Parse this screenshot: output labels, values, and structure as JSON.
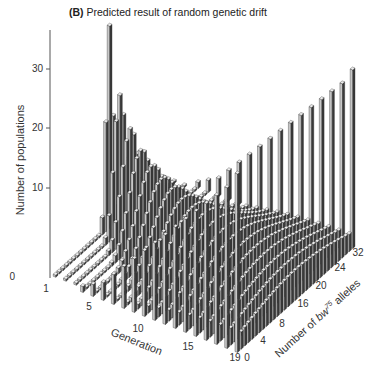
{
  "title": {
    "panel": "(B)",
    "text": "Predicted result of random genetic drift"
  },
  "chart_data": {
    "type": "bar3d",
    "title": "Predicted result of random genetic drift",
    "panel_label": "(B)",
    "zlabel": "Number of populations",
    "xlabel": "Generation",
    "ylabel": "Number of bw75 alleles",
    "ylabel_parts": {
      "prefix": "Number of ",
      "italic": "bw",
      "sup": "75",
      "suffix": " alleles"
    },
    "z_ticks": [
      0,
      10,
      20,
      30
    ],
    "x_ticks": [
      1,
      5,
      10,
      15,
      19
    ],
    "y_ticks": [
      0,
      4,
      8,
      16,
      20,
      24,
      32
    ],
    "x_range": [
      1,
      19
    ],
    "y_range": [
      0,
      32
    ],
    "z_range": [
      0,
      35
    ],
    "grid": false,
    "legend": null,
    "note": "Populations start with 16 bw75 alleles (out of 32); distribution spreads each generation; populations accumulate at 0 (loss) and 32 (fixation).",
    "series_by_generation": [
      {
        "generation": 1,
        "peak_alleles": 16,
        "peak_count": 34,
        "count_at_0": 0,
        "count_at_32": 0
      },
      {
        "generation": 2,
        "peak_alleles": 16,
        "peak_count": 23,
        "count_at_0": 0,
        "count_at_32": 0
      },
      {
        "generation": 3,
        "peak_alleles": 16,
        "peak_count": 18,
        "count_at_0": 0,
        "count_at_32": 0
      },
      {
        "generation": 4,
        "peak_alleles": 16,
        "peak_count": 15,
        "count_at_0": 1,
        "count_at_32": 1
      },
      {
        "generation": 5,
        "peak_alleles": 16,
        "peak_count": 13,
        "count_at_0": 2,
        "count_at_32": 2
      },
      {
        "generation": 6,
        "peak_alleles": 16,
        "peak_count": 11.5,
        "count_at_0": 3,
        "count_at_32": 3
      },
      {
        "generation": 7,
        "peak_alleles": 16,
        "peak_count": 10.5,
        "count_at_0": 5,
        "count_at_32": 5
      },
      {
        "generation": 8,
        "peak_alleles": 16,
        "peak_count": 9.5,
        "count_at_0": 7,
        "count_at_32": 7
      },
      {
        "generation": 9,
        "peak_alleles": 16,
        "peak_count": 8.8,
        "count_at_0": 9,
        "count_at_32": 9
      },
      {
        "generation": 10,
        "peak_alleles": 16,
        "peak_count": 8.2,
        "count_at_0": 11,
        "count_at_32": 11
      },
      {
        "generation": 11,
        "peak_alleles": 16,
        "peak_count": 7.6,
        "count_at_0": 13,
        "count_at_32": 13
      },
      {
        "generation": 12,
        "peak_alleles": 16,
        "peak_count": 7.1,
        "count_at_0": 15,
        "count_at_32": 15
      },
      {
        "generation": 13,
        "peak_alleles": 16,
        "peak_count": 6.7,
        "count_at_0": 17,
        "count_at_32": 17
      },
      {
        "generation": 14,
        "peak_alleles": 16,
        "peak_count": 6.3,
        "count_at_0": 19,
        "count_at_32": 19
      },
      {
        "generation": 15,
        "peak_alleles": 16,
        "peak_count": 6.0,
        "count_at_0": 21,
        "count_at_32": 21
      },
      {
        "generation": 16,
        "peak_alleles": 16,
        "peak_count": 5.7,
        "count_at_0": 23,
        "count_at_32": 23
      },
      {
        "generation": 17,
        "peak_alleles": 16,
        "peak_count": 5.4,
        "count_at_0": 25,
        "count_at_32": 25
      },
      {
        "generation": 18,
        "peak_alleles": 16,
        "peak_count": 5.2,
        "count_at_0": 27,
        "count_at_32": 27
      },
      {
        "generation": 19,
        "peak_alleles": 16,
        "peak_count": 5.0,
        "count_at_0": 30,
        "count_at_32": 30
      }
    ],
    "colors": {
      "bar_front": "#c8c8c8",
      "bar_side": "#3a3a3a",
      "bar_top": "#eeeeee",
      "edge": "#222222",
      "axis": "#555555"
    }
  },
  "labels": {
    "z_axis_title": "Number of populations",
    "x_axis_title": "Generation",
    "y_axis_prefix": "Number of ",
    "y_axis_italic": "bw",
    "y_axis_sup": "75",
    "y_axis_suffix": " alleles",
    "z_tick_0": "0",
    "z_tick_10": "10",
    "z_tick_20": "20",
    "z_tick_30": "30",
    "x_tick_1": "1",
    "x_tick_5": "5",
    "x_tick_10": "10",
    "x_tick_15": "15",
    "x_tick_19": "19",
    "y_tick_0": "0",
    "y_tick_4": "4",
    "y_tick_8": "8",
    "y_tick_16": "16",
    "y_tick_20": "20",
    "y_tick_24": "24",
    "y_tick_32": "32"
  }
}
